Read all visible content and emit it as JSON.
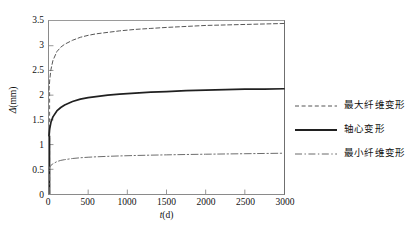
{
  "chart_data": {
    "type": "line",
    "title": "",
    "xlabel": "t(d)",
    "ylabel": "Δ(mm)",
    "xlim": [
      0,
      3000
    ],
    "ylim": [
      0,
      3.5
    ],
    "xticks": [
      "0",
      "500",
      "1000",
      "1500",
      "2000",
      "2500",
      "3000"
    ],
    "xtick_values": [
      0,
      500,
      1000,
      1500,
      2000,
      2500,
      3000
    ],
    "yticks": [
      "0",
      "0.5",
      "1",
      "1.5",
      "2",
      "2.5",
      "3",
      "3.5"
    ],
    "ytick_values": [
      0,
      0.5,
      1,
      1.5,
      2,
      2.5,
      3,
      3.5
    ],
    "grid": false,
    "legend_position": "right",
    "x": [
      0,
      10,
      25,
      50,
      100,
      150,
      200,
      300,
      400,
      500,
      600,
      750,
      900,
      1100,
      1300,
      1500,
      1750,
      2000,
      2250,
      2500,
      2750,
      3000
    ],
    "series": [
      {
        "name": "最大纤维变形",
        "linestyle": "dashed",
        "color": "#555555",
        "values": [
          2.1,
          2.32,
          2.52,
          2.7,
          2.88,
          2.97,
          3.03,
          3.11,
          3.17,
          3.21,
          3.24,
          3.27,
          3.3,
          3.33,
          3.35,
          3.37,
          3.39,
          3.41,
          3.42,
          3.43,
          3.44,
          3.45
        ]
      },
      {
        "name": "轴心变形",
        "linestyle": "solid",
        "color": "#202020",
        "values": [
          1.18,
          1.33,
          1.45,
          1.56,
          1.68,
          1.75,
          1.8,
          1.87,
          1.92,
          1.95,
          1.97,
          2.0,
          2.02,
          2.04,
          2.06,
          2.07,
          2.09,
          2.1,
          2.11,
          2.12,
          2.12,
          2.13
        ]
      },
      {
        "name": "最小纤维变形",
        "linestyle": "dashdot",
        "color": "#6b6b6b",
        "values": [
          0.5,
          0.545,
          0.58,
          0.61,
          0.655,
          0.68,
          0.695,
          0.718,
          0.733,
          0.744,
          0.752,
          0.762,
          0.77,
          0.779,
          0.786,
          0.792,
          0.799,
          0.805,
          0.81,
          0.815,
          0.82,
          0.825
        ]
      }
    ]
  },
  "legend": {
    "items": [
      {
        "label": "最大纤维变形",
        "style": "dashed"
      },
      {
        "label": "轴心变形",
        "style": "solid"
      },
      {
        "label": "最小纤维变形",
        "style": "dashdot"
      }
    ]
  },
  "axis_titles": {
    "x_symbol": "t",
    "x_unit": "(d)",
    "y_symbol": "Δ",
    "y_unit": "(mm)"
  },
  "colors": {
    "frame": "#8a8a8a",
    "max_fiber": "#555555",
    "centroid": "#202020",
    "min_fiber": "#6b6b6b",
    "text": "#111111",
    "background": "#ffffff"
  }
}
